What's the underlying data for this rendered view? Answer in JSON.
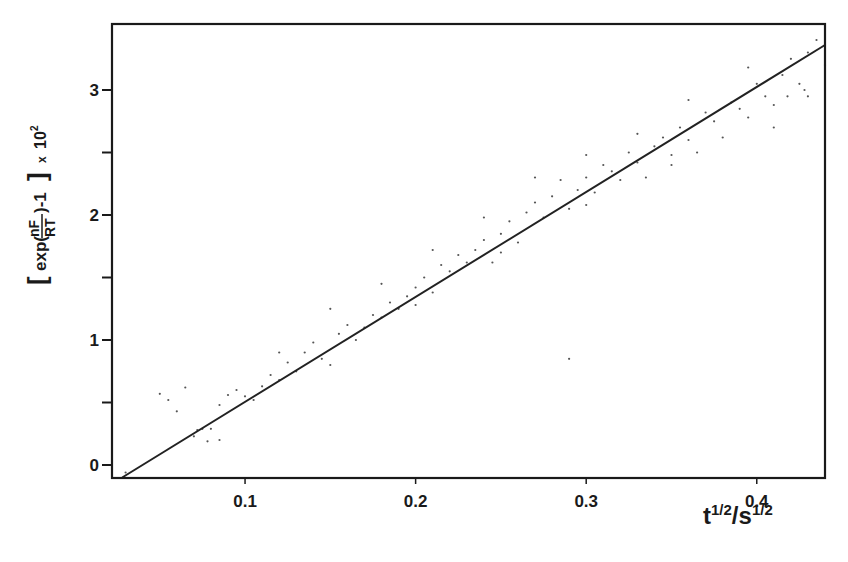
{
  "chart_data": {
    "type": "scatter",
    "title": "",
    "xlabel": "t^{1/2}/s^{1/2}",
    "xlabel_parts": {
      "base1": "t",
      "sup1": "1/2",
      "sep": "/",
      "base2": "s",
      "sup2": "1/2"
    },
    "ylabel": "[exp(nF/RT) - 1] x 10^2",
    "ylabel_parts": {
      "bracket_open": "[",
      "prefix": "exp(",
      "num": "nF",
      "den": "RT",
      "suffix": ")-1",
      "bracket_close": "]",
      "times": "x",
      "power_base": "10",
      "power_exp": "2"
    },
    "xlim": [
      0.022,
      0.44
    ],
    "ylim": [
      -0.1,
      3.5
    ],
    "grid": false,
    "legend": null,
    "x_ticks": [
      {
        "value": 0.1,
        "label": "0.1"
      },
      {
        "value": 0.2,
        "label": "0.2"
      },
      {
        "value": 0.3,
        "label": "0.3"
      },
      {
        "value": 0.4,
        "label": "0.4"
      }
    ],
    "y_ticks": [
      {
        "value": 0,
        "label": "0"
      },
      {
        "value": 1,
        "label": "1"
      },
      {
        "value": 2,
        "label": "2"
      },
      {
        "value": 3,
        "label": "3"
      }
    ],
    "y_minor_ticks": [
      0.5,
      1.5,
      2.5
    ],
    "fit_line": {
      "x": [
        0.028,
        0.44
      ],
      "y": [
        -0.1,
        3.36
      ],
      "slope": 8.4
    },
    "series": [
      {
        "name": "measurements",
        "points": [
          [
            0.05,
            0.57
          ],
          [
            0.055,
            0.52
          ],
          [
            0.06,
            0.43
          ],
          [
            0.065,
            0.62
          ],
          [
            0.07,
            0.23
          ],
          [
            0.072,
            0.28
          ],
          [
            0.075,
            0.29
          ],
          [
            0.078,
            0.19
          ],
          [
            0.08,
            0.29
          ],
          [
            0.085,
            0.48
          ],
          [
            0.09,
            0.56
          ],
          [
            0.095,
            0.6
          ],
          [
            0.1,
            0.55
          ],
          [
            0.105,
            0.52
          ],
          [
            0.11,
            0.63
          ],
          [
            0.115,
            0.72
          ],
          [
            0.12,
            0.68
          ],
          [
            0.125,
            0.82
          ],
          [
            0.13,
            0.75
          ],
          [
            0.135,
            0.9
          ],
          [
            0.14,
            0.98
          ],
          [
            0.145,
            0.85
          ],
          [
            0.15,
            0.8
          ],
          [
            0.155,
            1.05
          ],
          [
            0.16,
            1.12
          ],
          [
            0.165,
            1.0
          ],
          [
            0.17,
            1.1
          ],
          [
            0.175,
            1.2
          ],
          [
            0.18,
            1.18
          ],
          [
            0.185,
            1.3
          ],
          [
            0.19,
            1.25
          ],
          [
            0.195,
            1.35
          ],
          [
            0.2,
            1.42
          ],
          [
            0.205,
            1.5
          ],
          [
            0.21,
            1.38
          ],
          [
            0.215,
            1.6
          ],
          [
            0.22,
            1.55
          ],
          [
            0.225,
            1.68
          ],
          [
            0.23,
            1.62
          ],
          [
            0.235,
            1.72
          ],
          [
            0.24,
            1.8
          ],
          [
            0.245,
            1.62
          ],
          [
            0.25,
            1.85
          ],
          [
            0.255,
            1.95
          ],
          [
            0.26,
            1.78
          ],
          [
            0.265,
            2.02
          ],
          [
            0.27,
            2.1
          ],
          [
            0.275,
            1.98
          ],
          [
            0.28,
            2.15
          ],
          [
            0.285,
            2.28
          ],
          [
            0.29,
            2.05
          ],
          [
            0.295,
            2.2
          ],
          [
            0.3,
            2.3
          ],
          [
            0.305,
            2.18
          ],
          [
            0.31,
            2.4
          ],
          [
            0.315,
            2.35
          ],
          [
            0.32,
            2.28
          ],
          [
            0.325,
            2.5
          ],
          [
            0.33,
            2.42
          ],
          [
            0.335,
            2.3
          ],
          [
            0.34,
            2.55
          ],
          [
            0.345,
            2.62
          ],
          [
            0.35,
            2.48
          ],
          [
            0.355,
            2.7
          ],
          [
            0.36,
            2.6
          ],
          [
            0.365,
            2.5
          ],
          [
            0.37,
            2.82
          ],
          [
            0.375,
            2.75
          ],
          [
            0.38,
            2.62
          ],
          [
            0.385,
            2.9
          ],
          [
            0.39,
            2.85
          ],
          [
            0.395,
            2.78
          ],
          [
            0.4,
            3.05
          ],
          [
            0.405,
            2.95
          ],
          [
            0.41,
            2.88
          ],
          [
            0.415,
            3.12
          ],
          [
            0.42,
            3.25
          ],
          [
            0.425,
            3.05
          ],
          [
            0.43,
            3.3
          ],
          [
            0.435,
            3.4
          ],
          [
            0.44,
            3.2
          ],
          [
            0.418,
            2.95
          ],
          [
            0.428,
            3.0
          ],
          [
            0.395,
            3.18
          ],
          [
            0.36,
            2.92
          ],
          [
            0.33,
            2.65
          ],
          [
            0.3,
            2.48
          ],
          [
            0.27,
            2.3
          ],
          [
            0.24,
            1.98
          ],
          [
            0.21,
            1.72
          ],
          [
            0.18,
            1.45
          ],
          [
            0.15,
            1.25
          ],
          [
            0.12,
            0.9
          ],
          [
            0.2,
            1.28
          ],
          [
            0.25,
            1.7
          ],
          [
            0.3,
            2.08
          ],
          [
            0.35,
            2.4
          ],
          [
            0.41,
            2.7
          ],
          [
            0.43,
            2.95
          ],
          [
            0.29,
            0.85
          ],
          [
            0.085,
            0.2
          ],
          [
            0.03,
            -0.06
          ]
        ]
      }
    ]
  }
}
